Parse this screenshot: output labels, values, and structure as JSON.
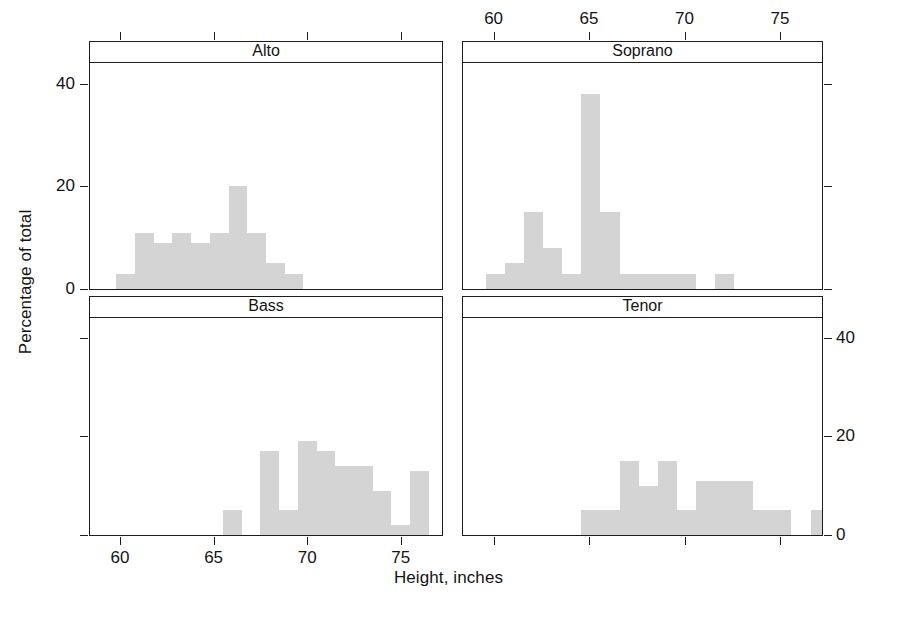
{
  "chart_data": {
    "type": "bar",
    "plot_kind": "trellis-histogram",
    "title": "",
    "xlabel": "Height, inches",
    "ylabel": "Percentage of total",
    "xlim": [
      58.4,
      77.2
    ],
    "ylim": [
      0,
      44
    ],
    "xticks": [
      60,
      65,
      70,
      75
    ],
    "xticklabels": [
      "60",
      "65",
      "70",
      "75"
    ],
    "yticks": [
      0,
      20,
      40
    ],
    "yticklabels": [
      "0",
      "20",
      "40"
    ],
    "grid": false,
    "legend": null,
    "bar_color": "#d4d4d4",
    "bin_width": 1,
    "panel_layout": {
      "rows": 2,
      "cols": 2,
      "order": [
        "Alto",
        "Soprano",
        "Bass",
        "Tenor"
      ]
    },
    "panels": [
      {
        "name": "Alto",
        "position": "top-left",
        "x_axis_side": "top",
        "y_axis_side": "left",
        "bins": [
          59.8,
          60.8,
          61.8,
          62.8,
          63.8,
          64.8,
          65.8,
          66.8,
          67.8,
          68.8,
          69.8
        ],
        "bin_starts": [
          59.8,
          60.8,
          61.8,
          62.8,
          63.8,
          64.8,
          65.8,
          66.8,
          67.8,
          68.8
        ],
        "values": [
          3,
          11,
          9,
          11,
          9,
          11,
          20,
          11,
          5,
          3
        ]
      },
      {
        "name": "Soprano",
        "position": "top-right",
        "x_axis_side": "top",
        "y_axis_side": "right",
        "bin_starts": [
          59.6,
          60.6,
          61.6,
          62.6,
          63.6,
          64.6,
          65.6,
          66.6,
          67.6,
          68.6,
          69.6,
          70.6,
          71.6
        ],
        "values": [
          3,
          5,
          15,
          8,
          3,
          38,
          15,
          3,
          3,
          3,
          3,
          0,
          3
        ]
      },
      {
        "name": "Bass",
        "position": "bottom-left",
        "x_axis_side": "bottom",
        "y_axis_side": "left",
        "bin_starts": [
          65.5,
          67.5,
          68.5,
          69.5,
          70.5,
          71.5,
          72.5,
          73.5,
          74.5,
          75.5
        ],
        "values": [
          5,
          17,
          5,
          19,
          17,
          14,
          14,
          9,
          2,
          13
        ]
      },
      {
        "name": "Tenor",
        "position": "bottom-right",
        "x_axis_side": "bottom",
        "y_axis_side": "right",
        "bin_starts": [
          64.6,
          65.6,
          66.6,
          67.6,
          68.6,
          69.6,
          70.6,
          71.6,
          72.6,
          73.6,
          74.6,
          75.6,
          76.6
        ],
        "values": [
          5,
          5,
          15,
          10,
          15,
          5,
          11,
          11,
          11,
          5,
          5,
          0,
          5
        ]
      }
    ]
  },
  "axes": {
    "x_title": "Height, inches",
    "y_title": "Percentage of total",
    "top_tick_labels": [
      "60",
      "65",
      "70",
      "75"
    ],
    "bottom_tick_labels": [
      "60",
      "65",
      "70",
      "75"
    ],
    "left_tick_labels": [
      "40",
      "20",
      "0"
    ],
    "right_tick_labels": [
      "40",
      "20",
      "0"
    ]
  },
  "panel_titles": {
    "alto": "Alto",
    "soprano": "Soprano",
    "bass": "Bass",
    "tenor": "Tenor"
  }
}
